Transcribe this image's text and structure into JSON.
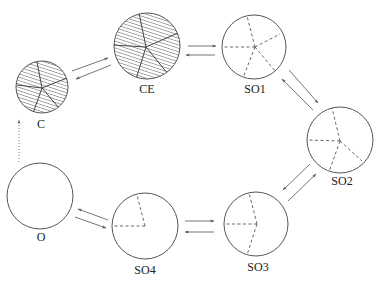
{
  "diagram": {
    "title": "",
    "colors": {
      "stroke": "#555555",
      "arrow": "#666666",
      "hatch": "#444444",
      "dash": "#555555",
      "background": "#ffffff"
    },
    "nodes": [
      {
        "id": "C",
        "label": "C",
        "cx": 42,
        "cy": 87,
        "r": 26,
        "fill": "hatched",
        "spokes": [
          [
            37,
            62
          ],
          [
            67,
            78
          ],
          [
            59,
            108
          ],
          [
            33,
            113
          ],
          [
            17,
            85
          ]
        ],
        "spoke_style": "solid",
        "hub": [
          42,
          88
        ],
        "label_x": 41,
        "label_y": 124
      },
      {
        "id": "CE",
        "label": "CE",
        "cx": 147,
        "cy": 46,
        "r": 33,
        "fill": "hatched",
        "spokes": [
          [
            139,
            13
          ],
          [
            178,
            33
          ],
          [
            168,
            74
          ],
          [
            136,
            79
          ],
          [
            113,
            45
          ]
        ],
        "spoke_style": "solid",
        "hub": [
          146,
          47
        ],
        "label_x": 147,
        "label_y": 89
      },
      {
        "id": "SO1",
        "label": "SO1",
        "cx": 254,
        "cy": 47,
        "r": 32,
        "fill": "empty",
        "spokes": [
          [
            247,
            16
          ],
          [
            280,
            34
          ],
          [
            276,
            72
          ],
          [
            243,
            78
          ],
          [
            222,
            47
          ]
        ],
        "spoke_style": "dashed",
        "hub": [
          255,
          47
        ],
        "label_x": 255,
        "label_y": 89
      },
      {
        "id": "SO2",
        "label": "SO2",
        "cx": 340,
        "cy": 140,
        "r": 33,
        "fill": "empty",
        "spokes": [
          [
            332,
            108
          ],
          [
            362,
            161
          ],
          [
            329,
            172
          ],
          [
            307,
            140
          ]
        ],
        "spoke_style": "dashed",
        "hub": [
          340,
          141
        ],
        "label_x": 342,
        "label_y": 181
      },
      {
        "id": "SO3",
        "label": "SO3",
        "cx": 256,
        "cy": 224,
        "r": 32,
        "fill": "empty",
        "spokes": [
          [
            249,
            193
          ],
          [
            247,
            255
          ],
          [
            224,
            224
          ]
        ],
        "spoke_style": "dashed",
        "hub": [
          257,
          224
        ],
        "label_x": 258,
        "label_y": 267
      },
      {
        "id": "SO4",
        "label": "SO4",
        "cx": 145,
        "cy": 226,
        "r": 33,
        "fill": "empty",
        "spokes": [
          [
            137,
            195
          ],
          [
            112,
            226
          ]
        ],
        "spoke_style": "dashed",
        "hub": [
          145,
          226
        ],
        "label_x": 145,
        "label_y": 270
      },
      {
        "id": "O",
        "label": "O",
        "cx": 40,
        "cy": 196,
        "r": 33,
        "fill": "empty",
        "spokes": [],
        "spoke_style": "none",
        "hub": null,
        "label_x": 41,
        "label_y": 237
      }
    ],
    "edges": [
      {
        "from": "C",
        "to": "CE",
        "x1": 72,
        "y1": 71,
        "x2": 108,
        "y2": 58,
        "style": "solid"
      },
      {
        "from": "CE",
        "to": "C",
        "x1": 111,
        "y1": 65,
        "x2": 76,
        "y2": 79,
        "style": "solid"
      },
      {
        "from": "CE",
        "to": "SO1",
        "x1": 188,
        "y1": 46,
        "x2": 216,
        "y2": 46,
        "style": "solid"
      },
      {
        "from": "SO1",
        "to": "CE",
        "x1": 215,
        "y1": 55,
        "x2": 186,
        "y2": 55,
        "style": "solid"
      },
      {
        "from": "SO1",
        "to": "SO2",
        "x1": 289,
        "y1": 70,
        "x2": 318,
        "y2": 103,
        "style": "solid"
      },
      {
        "from": "SO2",
        "to": "SO1",
        "x1": 313,
        "y1": 110,
        "x2": 282,
        "y2": 79,
        "style": "solid"
      },
      {
        "from": "SO2",
        "to": "SO3",
        "x1": 310,
        "y1": 164,
        "x2": 283,
        "y2": 190,
        "style": "solid"
      },
      {
        "from": "SO3",
        "to": "SO2",
        "x1": 288,
        "y1": 201,
        "x2": 316,
        "y2": 174,
        "style": "solid"
      },
      {
        "from": "SO4",
        "to": "SO3",
        "x1": 185,
        "y1": 221,
        "x2": 214,
        "y2": 221,
        "style": "solid"
      },
      {
        "from": "SO3",
        "to": "SO4",
        "x1": 214,
        "y1": 232,
        "x2": 185,
        "y2": 232,
        "style": "solid"
      },
      {
        "from": "SO4",
        "to": "O",
        "x1": 108,
        "y1": 220,
        "x2": 78,
        "y2": 209,
        "style": "solid"
      },
      {
        "from": "O",
        "to": "SO4",
        "x1": 75,
        "y1": 217,
        "x2": 106,
        "y2": 228,
        "style": "solid"
      },
      {
        "from": "O",
        "to": "C",
        "x1": 19,
        "y1": 162,
        "x2": 19,
        "y2": 120,
        "style": "dotted"
      }
    ]
  }
}
